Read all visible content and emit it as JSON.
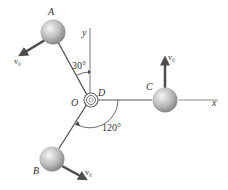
{
  "diagram": {
    "points": {
      "A": "A",
      "B": "B",
      "C": "C",
      "D": "D",
      "O": "O"
    },
    "axes": {
      "x": "x",
      "y": "y"
    },
    "velocities": {
      "A": "v₀",
      "B": "v₀",
      "C": "v₀"
    },
    "angles": {
      "rod_A_from_y": "30°",
      "rod_B_from_x": "120°"
    },
    "colors": {
      "rod": "#555555",
      "axis": "#8a8a8a",
      "arrow": "#4d4d4d",
      "sphere_light": "#f4f4f4",
      "sphere_dark": "#8c8c8c"
    }
  }
}
